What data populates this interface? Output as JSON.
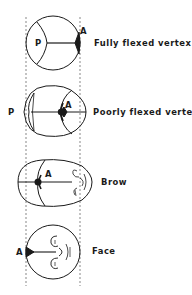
{
  "diagram": {
    "type": "fetal-head-presentation",
    "reference_lines": {
      "style": "dashed",
      "count": 2
    },
    "presentations": [
      {
        "label": "Fully flexed vertex",
        "markers": [
          "P",
          "A"
        ]
      },
      {
        "label": "Poorly flexed vertex",
        "markers": [
          "P",
          "A"
        ]
      },
      {
        "label": "Brow",
        "markers": [
          "A"
        ]
      },
      {
        "label": "Face",
        "markers": [
          "A"
        ]
      }
    ]
  },
  "colors": {
    "ink": "#1a1a1a",
    "background": "#ffffff"
  }
}
